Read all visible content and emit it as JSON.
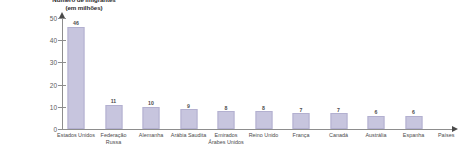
{
  "chart_data": {
    "type": "bar",
    "title": "Número de imigrantes",
    "subtitle": "(em milhões)",
    "xlabel": "Países",
    "ylabel": "",
    "ylim": [
      0,
      50
    ],
    "yticks": [
      "50",
      "40",
      "30",
      "20",
      "10",
      "0"
    ],
    "ytick_values": [
      50,
      40,
      30,
      20,
      10,
      0
    ],
    "grid": false,
    "legend": "none",
    "categories": [
      "Estados Unidos",
      "Federação Russa",
      "Alemanha",
      "Arábia Saudita",
      "Emirados Árabes Unidos",
      "Reino Unido",
      "França",
      "Canadá",
      "Austrália",
      "Espanha"
    ],
    "values": [
      46,
      11,
      10,
      9,
      8,
      8,
      7,
      7,
      6,
      6
    ],
    "value_labels": [
      "46",
      "11",
      "10",
      "9",
      "8",
      "8",
      "7",
      "7",
      "6",
      "6"
    ],
    "bar_color": "#c7c5de",
    "axis_color": "#8d8d8d",
    "text_color": "#4b4b4b"
  }
}
